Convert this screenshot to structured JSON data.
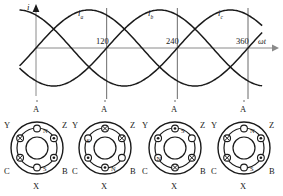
{
  "figure": {
    "line_color": "#1a1a1a",
    "grid_color": "#6b6b6b",
    "axis_color": "#8a8a8a"
  },
  "waveform": {
    "vertical_axis_label": "i",
    "horizontal_axis_label": "ωt",
    "curve_labels": [
      {
        "base": "i",
        "sub": "a"
      },
      {
        "base": "i",
        "sub": "b"
      },
      {
        "base": "i",
        "sub": "c"
      }
    ],
    "tick_labels": [
      "120",
      "240",
      "360"
    ]
  },
  "chart_data": {
    "type": "line",
    "xlabel": "ωt",
    "ylabel": "i",
    "xlim": [
      -30,
      390
    ],
    "ylim": [
      -1.15,
      1.15
    ],
    "xticks": [
      120,
      240,
      360
    ],
    "xtick_labels": [
      "120",
      "240",
      "360"
    ],
    "grid": "vertical gridlines at 0, 120, 240, 360 degrees extending down to stator diagrams",
    "legend": "inline curve labels above peaks",
    "series": [
      {
        "name": "i_a",
        "phase_deg": 0,
        "amplitude": 1,
        "label": "i_a",
        "peak_at_deg": 90
      },
      {
        "name": "i_b",
        "phase_deg": -120,
        "amplitude": 1,
        "label": "i_b",
        "peak_at_deg": 210
      },
      {
        "name": "i_c",
        "phase_deg": -240,
        "amplitude": 1,
        "label": "i_c",
        "peak_at_deg": 330
      }
    ]
  },
  "stators": {
    "terminal_labels": {
      "top": "A",
      "bottom": "X",
      "upper_left": "Y",
      "upper_right": "Z",
      "lower_left": "C",
      "lower_right": "B"
    },
    "instances": [
      {
        "instant": "0",
        "slots": [
          {
            "pos": "top",
            "symbol": "circle"
          },
          {
            "pos": "upper_right",
            "symbol": "dot"
          },
          {
            "pos": "lower_right",
            "symbol": "dot"
          },
          {
            "pos": "bottom",
            "symbol": "circle"
          },
          {
            "pos": "lower_left",
            "symbol": "cross"
          },
          {
            "pos": "upper_left",
            "symbol": "cross"
          }
        ],
        "poles": [
          {
            "label": "N",
            "at": "top"
          },
          {
            "label": "S",
            "at": "bottom"
          }
        ]
      },
      {
        "instant": "120",
        "slots": [
          {
            "pos": "top",
            "symbol": "cross"
          },
          {
            "pos": "upper_right",
            "symbol": "cross"
          },
          {
            "pos": "lower_right",
            "symbol": "circle"
          },
          {
            "pos": "bottom",
            "symbol": "dot"
          },
          {
            "pos": "lower_left",
            "symbol": "dot"
          },
          {
            "pos": "upper_left",
            "symbol": "circle"
          }
        ],
        "poles": [
          {
            "label": "S",
            "at": "upper_left"
          },
          {
            "label": "N",
            "at": "bottom"
          }
        ]
      },
      {
        "instant": "240",
        "slots": [
          {
            "pos": "top",
            "symbol": "dot"
          },
          {
            "pos": "upper_right",
            "symbol": "circle"
          },
          {
            "pos": "lower_right",
            "symbol": "cross"
          },
          {
            "pos": "bottom",
            "symbol": "cross"
          },
          {
            "pos": "lower_left",
            "symbol": "circle"
          },
          {
            "pos": "upper_left",
            "symbol": "dot"
          }
        ],
        "poles": [
          {
            "label": "S",
            "at": "top"
          },
          {
            "label": "N",
            "at": "lower_left"
          }
        ]
      },
      {
        "instant": "360",
        "slots": [
          {
            "pos": "top",
            "symbol": "circle"
          },
          {
            "pos": "upper_right",
            "symbol": "dot"
          },
          {
            "pos": "lower_right",
            "symbol": "dot"
          },
          {
            "pos": "bottom",
            "symbol": "circle"
          },
          {
            "pos": "lower_left",
            "symbol": "cross"
          },
          {
            "pos": "upper_left",
            "symbol": "cross"
          }
        ],
        "poles": [
          {
            "label": "N",
            "at": "top"
          },
          {
            "label": "S",
            "at": "bottom"
          }
        ]
      }
    ]
  }
}
